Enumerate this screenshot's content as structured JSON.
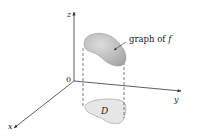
{
  "figure": {
    "axes": {
      "z_label": "z",
      "y_label": "y",
      "x_label": "x",
      "origin_label": "0"
    },
    "surface_label": {
      "prefix": "graph of ",
      "func": "f"
    },
    "region_label": "D",
    "colors": {
      "axis": "#333333",
      "surface_fill": "#b8b8b8",
      "surface_highlight": "#d9d9d9",
      "region_fill": "#e6e6e6",
      "region_stroke": "#9a9a9a",
      "dash": "#444444"
    }
  }
}
